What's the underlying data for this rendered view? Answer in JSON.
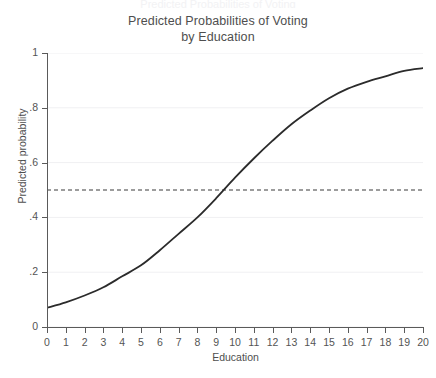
{
  "top_clipped_text": "Predicted Probabilities of Voting",
  "chart_data": {
    "type": "line",
    "title": "Predicted Probabilities of Voting",
    "subtitle": "by Education",
    "title_lines": [
      "Predicted Probabilities of Voting",
      "by Education"
    ],
    "xlabel": "Education",
    "ylabel": "Predicted probability",
    "xlim": [
      0,
      20
    ],
    "ylim": [
      0,
      1
    ],
    "grid": true,
    "grid_axis": "y",
    "legend": "none",
    "x_ticks": [
      0,
      1,
      2,
      3,
      4,
      5,
      6,
      7,
      8,
      9,
      10,
      11,
      12,
      13,
      14,
      15,
      16,
      17,
      18,
      19,
      20
    ],
    "x_tick_labels": [
      "0",
      "1",
      "2",
      "3",
      "4",
      "5",
      "6",
      "7",
      "8",
      "9",
      "10",
      "11",
      "12",
      "13",
      "14",
      "15",
      "16",
      "17",
      "18",
      "19",
      "20"
    ],
    "y_ticks": [
      0,
      0.2,
      0.4,
      0.6,
      0.8,
      1
    ],
    "y_tick_labels": [
      "0",
      ".2",
      ".4",
      ".6",
      ".8",
      "1"
    ],
    "line_color": "#2b2b2b",
    "grid_color": "#f0f0f2",
    "axis_color": "#5a5a5a",
    "background_color": "#ffffff",
    "reference_line": {
      "name": "probability-half-reference",
      "orientation": "horizontal",
      "y": 0.5,
      "style": "dashed",
      "color": "#3a3a3a"
    },
    "series": [
      {
        "name": "Predicted probability of voting",
        "style": "solid",
        "x": [
          0,
          1,
          2,
          3,
          4,
          5,
          6,
          7,
          8,
          9,
          10,
          11,
          12,
          13,
          14,
          15,
          16,
          17,
          18,
          19,
          20
        ],
        "values": [
          0.07,
          0.09,
          0.115,
          0.145,
          0.185,
          0.225,
          0.28,
          0.34,
          0.4,
          0.47,
          0.545,
          0.615,
          0.68,
          0.74,
          0.79,
          0.835,
          0.87,
          0.895,
          0.915,
          0.935,
          0.945
        ]
      }
    ],
    "annotations": [
      {
        "text": "curve crosses 0.5 at Education ≈ 9.5"
      }
    ]
  }
}
